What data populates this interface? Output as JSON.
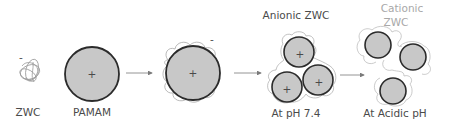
{
  "diagram": {
    "title": "",
    "colors": {
      "particle_fill": "#c8c8c8",
      "particle_stroke": "#2b2b2b",
      "polymer_stroke": "#9a9a9a",
      "arrow": "#7a7a7a",
      "text": "#4a4a4a",
      "text_muted": "#a8a8a8"
    },
    "nodes": [
      {
        "id": "zwc",
        "label": "ZWC",
        "charge": "-"
      },
      {
        "id": "pamam",
        "label": "PAMAM",
        "charge": "+"
      },
      {
        "id": "coated",
        "label": "",
        "charge_core": "+",
        "charge_shell": "-"
      },
      {
        "id": "anionic_cluster",
        "label_top": "Anionic ZWC",
        "label_bottom": "At pH 7.4",
        "charge": "+"
      },
      {
        "id": "cationic_separated",
        "label_top_line1": "Cationic",
        "label_top_line2": "ZWC",
        "label_bottom": "At Acidic pH"
      }
    ],
    "edges": [
      {
        "from": "pamam",
        "to": "coated"
      },
      {
        "from": "coated",
        "to": "anionic_cluster"
      },
      {
        "from": "anionic_cluster",
        "to": "cationic_separated"
      }
    ],
    "symbols": {
      "plus": "+",
      "minus": "-"
    }
  }
}
